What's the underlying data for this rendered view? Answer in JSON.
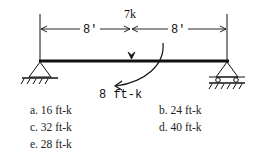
{
  "diagram": {
    "load_label": "7k",
    "left_span_label": "8'",
    "right_span_label": "8'",
    "moment_label": "8 ft-k",
    "left_support": "pin",
    "right_support": "roller"
  },
  "choices": [
    {
      "key": "a",
      "text": "a. 16 ft-k"
    },
    {
      "key": "b",
      "text": "b. 24 ft-k"
    },
    {
      "key": "c",
      "text": "c. 32 ft-k"
    },
    {
      "key": "d",
      "text": "d. 40 ft-k"
    },
    {
      "key": "e",
      "text": "e. 28 ft-k"
    }
  ]
}
